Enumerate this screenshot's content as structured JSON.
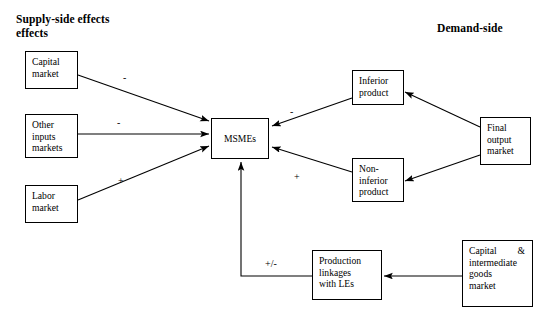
{
  "figure": {
    "type": "diagram",
    "subtype": "flow-diagram",
    "background_color": "#ffffff",
    "line_color": "#000000"
  },
  "headings": {
    "supply_side": "Supply-side effects\neffects",
    "demand_side": "Demand-side"
  },
  "nodes": {
    "capital_market": "Capital\nmarket",
    "other_inputs_markets": "Other\ninputs\nmarkets",
    "labor_market": "Labor\nmarket",
    "msmes": "MSMEs",
    "inferior_product": "Inferior\nproduct",
    "non_inferior_product": "Non-\ninferior\nproduct",
    "final_output_market": "Final\noutput\nmarket",
    "production_linkages": "Production\nlinkages\nwith LEs",
    "capital_intermediate_word1": "Capital",
    "capital_intermediate_word2": "&",
    "capital_intermediate_rest": "intermediate\ngoods\nmarket"
  },
  "edge_labels": {
    "capital_to_msmes": "-",
    "other_inputs_to_msmes": "-",
    "labor_to_msmes": "+",
    "inferior_to_msmes": "-",
    "non_inferior_to_msmes": "+",
    "production_linkages_to_msmes": "+/-"
  },
  "edges": [
    {
      "from": "capital_market",
      "to": "msmes",
      "sign": "-"
    },
    {
      "from": "other_inputs_markets",
      "to": "msmes",
      "sign": "-"
    },
    {
      "from": "labor_market",
      "to": "msmes",
      "sign": "+"
    },
    {
      "from": "inferior_product",
      "to": "msmes",
      "sign": "-"
    },
    {
      "from": "non_inferior_product",
      "to": "msmes",
      "sign": "+"
    },
    {
      "from": "final_output_market",
      "to": "inferior_product",
      "sign": ""
    },
    {
      "from": "final_output_market",
      "to": "non_inferior_product",
      "sign": ""
    },
    {
      "from": "capital_intermediate_goods_market",
      "to": "production_linkages",
      "sign": ""
    },
    {
      "from": "production_linkages",
      "to": "msmes",
      "sign": "+/-"
    }
  ]
}
